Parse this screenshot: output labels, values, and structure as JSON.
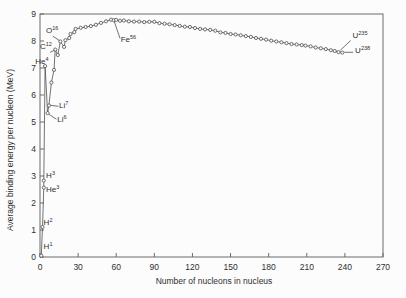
{
  "chart_data": {
    "type": "line",
    "title": "",
    "xlabel": "Number of nucleons in nucleus",
    "ylabel": "Average binding energy per nucleon (MeV)",
    "xlim": [
      0,
      270
    ],
    "ylim": [
      0,
      9
    ],
    "xticks": [
      0,
      30,
      60,
      90,
      120,
      150,
      180,
      210,
      240,
      270
    ],
    "yticks": [
      0,
      1,
      2,
      3,
      4,
      5,
      6,
      7,
      8,
      9
    ],
    "grid": false,
    "legend": false,
    "marker": "open-circle",
    "points": [
      [
        1,
        0.05
      ],
      [
        2,
        1.11
      ],
      [
        3,
        2.57
      ],
      [
        3,
        2.83
      ],
      [
        4,
        7.07
      ],
      [
        6,
        5.33
      ],
      [
        7,
        5.61
      ],
      [
        9,
        6.46
      ],
      [
        11,
        6.93
      ],
      [
        12,
        7.68
      ],
      [
        14,
        7.48
      ],
      [
        16,
        7.98
      ],
      [
        19,
        7.78
      ],
      [
        20,
        8.03
      ],
      [
        23,
        8.11
      ],
      [
        24,
        8.26
      ],
      [
        27,
        8.33
      ],
      [
        28,
        8.45
      ],
      [
        32,
        8.49
      ],
      [
        36,
        8.52
      ],
      [
        40,
        8.55
      ],
      [
        44,
        8.6
      ],
      [
        48,
        8.67
      ],
      [
        52,
        8.73
      ],
      [
        56,
        8.79
      ],
      [
        58,
        8.77
      ],
      [
        60,
        8.78
      ],
      [
        63,
        8.75
      ],
      [
        66,
        8.76
      ],
      [
        70,
        8.73
      ],
      [
        74,
        8.72
      ],
      [
        78,
        8.72
      ],
      [
        82,
        8.7
      ],
      [
        86,
        8.71
      ],
      [
        90,
        8.71
      ],
      [
        94,
        8.66
      ],
      [
        98,
        8.64
      ],
      [
        102,
        8.62
      ],
      [
        106,
        8.59
      ],
      [
        110,
        8.56
      ],
      [
        114,
        8.53
      ],
      [
        118,
        8.52
      ],
      [
        122,
        8.48
      ],
      [
        126,
        8.45
      ],
      [
        130,
        8.43
      ],
      [
        134,
        8.41
      ],
      [
        138,
        8.38
      ],
      [
        142,
        8.32
      ],
      [
        146,
        8.3
      ],
      [
        150,
        8.26
      ],
      [
        154,
        8.24
      ],
      [
        158,
        8.21
      ],
      [
        162,
        8.18
      ],
      [
        166,
        8.15
      ],
      [
        170,
        8.11
      ],
      [
        174,
        8.08
      ],
      [
        178,
        8.05
      ],
      [
        182,
        8.01
      ],
      [
        186,
        7.98
      ],
      [
        190,
        7.95
      ],
      [
        194,
        7.92
      ],
      [
        198,
        7.89
      ],
      [
        202,
        7.87
      ],
      [
        206,
        7.85
      ],
      [
        209,
        7.83
      ],
      [
        213,
        7.8
      ],
      [
        217,
        7.76
      ],
      [
        221,
        7.73
      ],
      [
        225,
        7.7
      ],
      [
        229,
        7.66
      ],
      [
        232,
        7.63
      ],
      [
        235,
        7.59
      ],
      [
        238,
        7.57
      ]
    ],
    "annotations": [
      {
        "base": "H",
        "sup": "1",
        "label_at": [
          2.8,
          0.28
        ],
        "point": [
          1,
          0.05
        ]
      },
      {
        "base": "H",
        "sup": "2",
        "label_at": [
          2.8,
          1.18
        ],
        "point": [
          2,
          1.11
        ]
      },
      {
        "base": "He",
        "sup": "3",
        "label_at": [
          4.8,
          2.42
        ],
        "point": [
          3,
          2.57
        ]
      },
      {
        "base": "H",
        "sup": "3",
        "label_at": [
          4.8,
          2.92
        ],
        "point": [
          3,
          2.83
        ]
      },
      {
        "base": "He",
        "sup": "4",
        "label_at": [
          -3.8,
          7.15
        ],
        "point": [
          4,
          7.07
        ]
      },
      {
        "base": "Li",
        "sup": "6",
        "label_at": [
          13.5,
          5.02
        ],
        "point": [
          6,
          5.33
        ],
        "leader": [
          [
            7.2,
            5.28
          ],
          [
            13.0,
            5.1
          ]
        ]
      },
      {
        "base": "Li",
        "sup": "7",
        "label_at": [
          15.0,
          5.52
        ],
        "point": [
          7,
          5.61
        ],
        "leader": [
          [
            8.3,
            5.62
          ],
          [
            14.5,
            5.58
          ]
        ]
      },
      {
        "base": "C",
        "sup": "12",
        "label_at": [
          0.0,
          7.72
        ],
        "point": [
          12,
          7.68
        ],
        "leader": [
          [
            8.0,
            7.58
          ],
          [
            11.3,
            7.66
          ]
        ]
      },
      {
        "base": "O",
        "sup": "16",
        "label_at": [
          4.7,
          8.3
        ],
        "point": [
          16,
          7.98
        ],
        "leader": [
          [
            10.0,
            8.18
          ],
          [
            15.3,
            8.02
          ]
        ]
      },
      {
        "base": "Fe",
        "sup": "56",
        "label_at": [
          63.5,
          7.98
        ],
        "point": [
          56,
          8.79
        ],
        "leader": [
          [
            58.5,
            8.72
          ],
          [
            63.0,
            8.1
          ]
        ]
      },
      {
        "base": "U",
        "sup": "235",
        "label_at": [
          246.0,
          8.12
        ],
        "point": [
          235,
          7.59
        ],
        "leader": [
          [
            236.5,
            7.66
          ],
          [
            244.5,
            8.02
          ]
        ]
      },
      {
        "base": "U",
        "sup": "238",
        "label_at": [
          248.0,
          7.56
        ],
        "point": [
          238,
          7.57
        ],
        "leader": [
          [
            239.5,
            7.58
          ],
          [
            246.5,
            7.58
          ]
        ]
      }
    ],
    "colors": {
      "background": "#fcfcfc",
      "axis": "#6b6b6b",
      "line": "#4f4f4f",
      "marker_fill": "#fafafa",
      "text": "#2f2f2f"
    }
  }
}
